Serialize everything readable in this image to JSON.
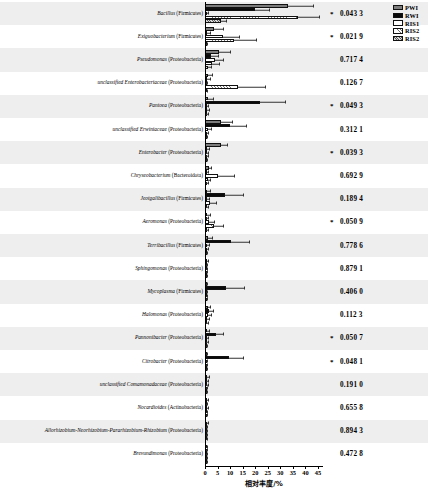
{
  "chart": {
    "type": "bar",
    "orientation": "horizontal",
    "title": "",
    "xlabel": "相对丰度/%",
    "ylabel": "",
    "xlim": [
      0,
      47
    ],
    "xticks": [
      0,
      5,
      10,
      15,
      20,
      25,
      30,
      35,
      40,
      45
    ],
    "xticklabels": [
      "0",
      "5",
      "10",
      "15",
      "20",
      "25",
      "30",
      "35",
      "40",
      "45"
    ],
    "grid": false,
    "legend_position": "top-right",
    "series_names": [
      "PWI",
      "RWI",
      "RIS1",
      "RIS2",
      "RIS2"
    ],
    "series_colors": [
      "#7d7d7d",
      "#0a0a0a",
      "#ffffff",
      "#ffffff",
      "#d9d9d9"
    ],
    "pvalue_column_header": "",
    "significance_marker": "*"
  },
  "legend": [
    {
      "label": "PWI",
      "swatch": "s-pwi"
    },
    {
      "label": "RWI",
      "swatch": "s-rwi"
    },
    {
      "label": "RIS1",
      "swatch": "s-ris1"
    },
    {
      "label": "RIS2",
      "swatch": "s-ris2a"
    },
    {
      "label": "RIS2",
      "swatch": "s-ris2b"
    }
  ],
  "axis": {
    "title": "相对丰度/%",
    "ticklabels": [
      "0",
      "5",
      "10",
      "15",
      "20",
      "25",
      "30",
      "35",
      "40",
      "45"
    ]
  },
  "chart_data": {
    "type": "bar",
    "orientation": "horizontal",
    "title": "",
    "xlabel": "相对丰度/%",
    "ylabel": "",
    "xlim": [
      0,
      47
    ],
    "xticks": [
      0,
      5,
      10,
      15,
      20,
      25,
      30,
      35,
      40,
      45
    ],
    "grid": false,
    "legend": [
      "PWI",
      "RWI",
      "RIS1",
      "RIS2",
      "RIS2"
    ],
    "categories": [
      "Bacillus (Firmicutes)",
      "Exiguobacterium (Firmicutes)",
      "Pseudomonas (Proteobacteria)",
      "unclassified Enterobacteriaceae (Proteobacteria)",
      "Pantoea (Proteobacteria)",
      "unclassified Erwiniaceae (Proteobacteria)",
      "Enterobacter (Proteobacteria)",
      "Chryseobacterium (Bacteroidota)",
      "Jeotgalibacillus (Firmicutes)",
      "Aeromonas (Proteobacteria)",
      "Terribacillus (Firmicutes)",
      "Sphingomonas (Proteobacteria)",
      "Mycoplasma (Firmicutes)",
      "Halomonas (Proteobacteria)",
      "Pannonibacter (Proteobacteria)",
      "Citrobacter (Proteobacteria)",
      "unclassified Comamonadaceae (Proteobacteria)",
      "Nocardioides (Actinobacteria)",
      "Allorhizobium-Neorhizobium-Pararhizobium-Rhizobium (Proteobacteria)",
      "Brevundimonas (Proteobacteria)"
    ],
    "pvalues": [
      "0.043 3",
      "0.021 9",
      "0.717 4",
      "0.126 7",
      "0.049 3",
      "0.312 1",
      "0.039 3",
      "0.692 9",
      "0.189 4",
      "0.050 9",
      "0.778 6",
      "0.879 1",
      "0.406 0",
      "0.112 3",
      "0.050 7",
      "0.048 1",
      "0.191 0",
      "0.655 8",
      "0.894 3",
      "0.472 8"
    ],
    "significant": [
      true,
      true,
      false,
      false,
      true,
      false,
      true,
      false,
      false,
      true,
      false,
      false,
      false,
      false,
      true,
      true,
      false,
      false,
      false,
      false
    ],
    "series": [
      {
        "name": "PWI",
        "values": [
          33.0,
          3.6,
          5.6,
          1.0,
          1.2,
          6.2,
          6.4,
          1.4,
          0.9,
          0.8,
          1.2,
          0.7,
          0.5,
          1.0,
          0.7,
          0.3,
          0.8,
          0.7,
          0.6,
          0.5
        ],
        "errors": [
          10.0,
          3.4,
          4.2,
          1.6,
          2.0,
          4.4,
          2.2,
          1.1,
          1.0,
          1.1,
          1.4,
          0.6,
          0.4,
          1.0,
          0.8,
          0.3,
          0.7,
          0.5,
          0.5,
          0.4
        ]
      },
      {
        "name": "RWI",
        "values": [
          20.0,
          0.8,
          2.3,
          0.9,
          22.0,
          10.0,
          0.6,
          0.6,
          8.0,
          0.5,
          10.5,
          0.4,
          8.5,
          1.6,
          4.2,
          9.5,
          0.5,
          0.4,
          0.3,
          0.3
        ],
        "errors": [
          5.5,
          1.0,
          2.8,
          1.2,
          10.0,
          6.5,
          0.8,
          0.6,
          7.0,
          0.7,
          7.0,
          0.4,
          7.0,
          1.6,
          3.0,
          5.5,
          0.5,
          0.4,
          0.3,
          0.3
        ]
      },
      {
        "name": "RIS1",
        "values": [
          0.6,
          7.0,
          4.0,
          0.4,
          0.6,
          1.0,
          0.5,
          5.0,
          0.6,
          1.5,
          0.7,
          0.3,
          0.4,
          1.2,
          0.6,
          0.3,
          0.5,
          0.6,
          0.4,
          0.3
        ],
        "errors": [
          0.6,
          6.5,
          3.2,
          0.5,
          0.7,
          1.2,
          0.6,
          6.5,
          0.8,
          2.0,
          0.8,
          0.3,
          0.4,
          1.1,
          0.7,
          0.3,
          0.5,
          0.5,
          0.4,
          0.3
        ]
      },
      {
        "name": "RIS2",
        "values": [
          37.0,
          11.5,
          2.6,
          13.0,
          0.8,
          0.6,
          0.5,
          1.0,
          2.0,
          3.6,
          0.6,
          0.3,
          0.3,
          0.7,
          0.5,
          0.3,
          0.4,
          0.4,
          0.3,
          0.3
        ],
        "errors": [
          8.5,
          9.0,
          3.0,
          11.0,
          0.9,
          0.7,
          0.6,
          1.0,
          2.2,
          3.6,
          0.6,
          0.3,
          0.3,
          0.7,
          0.6,
          0.3,
          0.4,
          0.4,
          0.3,
          0.3
        ]
      },
      {
        "name": "RIS2",
        "values": [
          6.5,
          0.4,
          1.2,
          0.4,
          0.5,
          0.4,
          0.4,
          0.5,
          0.5,
          0.5,
          0.4,
          0.3,
          0.3,
          0.5,
          0.4,
          0.3,
          0.3,
          0.3,
          0.3,
          0.3
        ],
        "errors": [
          2.0,
          0.4,
          1.2,
          0.4,
          0.5,
          0.4,
          0.4,
          0.5,
          0.5,
          0.5,
          0.4,
          0.3,
          0.3,
          0.5,
          0.4,
          0.3,
          0.3,
          0.3,
          0.3,
          0.3
        ]
      }
    ]
  },
  "labels": [
    {
      "italic": "Bacillus",
      "roman": " (Firmicutes)"
    },
    {
      "italic": "Exiguobacterium",
      "roman": " (Firmicutes)"
    },
    {
      "italic": "Pseudomonas",
      "roman": " (Proteobacteria)"
    },
    {
      "italic": "unclassified Enterobacteriaceae",
      "roman": " (Proteobacteria)"
    },
    {
      "italic": "Pantoea",
      "roman": " (Proteobacteria)"
    },
    {
      "italic": "unclassified Erwiniaceae",
      "roman": " (Proteobacteria)"
    },
    {
      "italic": "Enterobacter",
      "roman": " (Proteobacteria)"
    },
    {
      "italic": "Chryseobacterium",
      "roman": " (Bacteroidota)"
    },
    {
      "italic": "Jeotgalibacillus",
      "roman": " (Firmicutes)"
    },
    {
      "italic": "Aeromonas",
      "roman": " (Proteobacteria)"
    },
    {
      "italic": "Terribacillus",
      "roman": " (Firmicutes)"
    },
    {
      "italic": "Sphingomonas",
      "roman": " (Proteobacteria)"
    },
    {
      "italic": "Mycoplasma",
      "roman": " (Firmicutes)"
    },
    {
      "italic": "Halomonas",
      "roman": " (Proteobacteria)"
    },
    {
      "italic": "Pannonibacter",
      "roman": " (Proteobacteria)"
    },
    {
      "italic": "Citrobacter",
      "roman": " (Proteobacteria)"
    },
    {
      "italic": "unclassified Comamonadaceae",
      "roman": " (Proteobacteria)"
    },
    {
      "italic": "Nocardioides",
      "roman": " (Actinobacteria)"
    },
    {
      "italic": "Allorhizobium-Neorhizobium-Pararhizobium-Rhizobium",
      "roman": " (Proteobacteria)"
    },
    {
      "italic": "Brevundimonas",
      "roman": " (Proteobacteria)"
    }
  ]
}
